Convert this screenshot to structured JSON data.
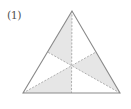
{
  "label": "(1)",
  "colors": {
    "outline": "#8a8a8a",
    "median": "#a8a8a8",
    "shade": "#e6e6e6",
    "background": "#ffffff"
  },
  "triangle": {
    "apex": [
      72,
      11
    ],
    "base_left": [
      23,
      93
    ],
    "base_right": [
      120,
      93
    ],
    "centroid": [
      71.7,
      65.7
    ],
    "left_mid": [
      47.5,
      52
    ],
    "right_mid": [
      96,
      52
    ],
    "base_mid": [
      71.5,
      93
    ]
  },
  "shaded_regions": [
    "apex-leftmid-centroid",
    "centroid-rightmid-baseright",
    "baseleft-centroid-basemid"
  ]
}
